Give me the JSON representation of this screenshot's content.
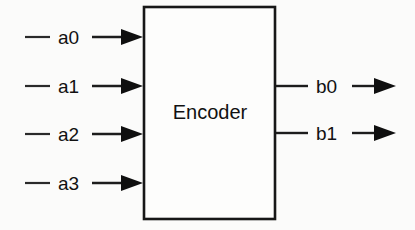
{
  "diagram": {
    "block": {
      "label": "Encoder",
      "name": "encoder-block",
      "x": 144,
      "y": 7,
      "width": 131,
      "height": 212,
      "fill": "#fdfdfc",
      "stroke": "#171717"
    },
    "canvas": {
      "width": 415,
      "height": 230,
      "background": "#fbfbfa"
    },
    "line_color": "#1c1c1c",
    "text_color": "#111111",
    "inputs": [
      {
        "label": "a0",
        "y": 37,
        "stub_x1": 25,
        "stub_x2": 50,
        "label_x": 58,
        "wire_x1": 92,
        "wire_x2": 143
      },
      {
        "label": "a1",
        "y": 86,
        "stub_x1": 25,
        "stub_x2": 50,
        "label_x": 58,
        "wire_x1": 92,
        "wire_x2": 143
      },
      {
        "label": "a2",
        "y": 134,
        "stub_x1": 25,
        "stub_x2": 50,
        "label_x": 58,
        "wire_x1": 92,
        "wire_x2": 143
      },
      {
        "label": "a3",
        "y": 183,
        "stub_x1": 25,
        "stub_x2": 50,
        "label_x": 58,
        "wire_x1": 92,
        "wire_x2": 143
      }
    ],
    "outputs": [
      {
        "label": "b0",
        "y": 86,
        "stub_x1": 276,
        "stub_x2": 308,
        "label_x": 316,
        "wire_x1": 352,
        "wire_x2": 396
      },
      {
        "label": "b1",
        "y": 133,
        "stub_x1": 276,
        "stub_x2": 308,
        "label_x": 316,
        "wire_x1": 352,
        "wire_x2": 396
      }
    ],
    "arrow": {
      "length": 22,
      "half_height": 8
    }
  }
}
